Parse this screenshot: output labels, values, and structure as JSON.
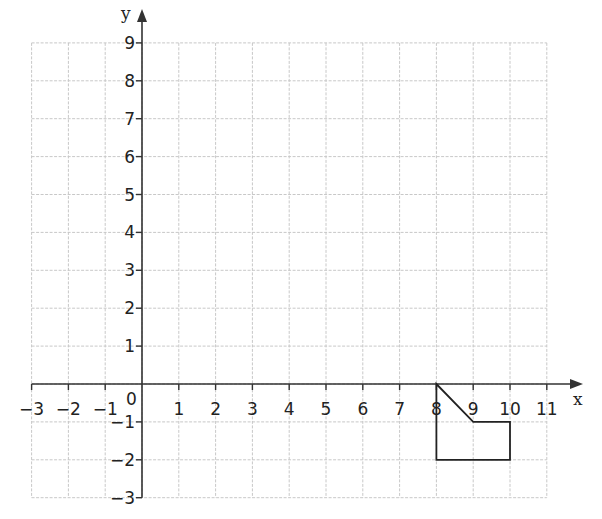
{
  "diagram": {
    "type": "coordinate-grid",
    "x_axis": {
      "label": "x",
      "min": -3,
      "max": 11,
      "ticks": [
        -3,
        -2,
        -1,
        1,
        2,
        3,
        4,
        5,
        6,
        7,
        8,
        9,
        10,
        11
      ],
      "tick_labels": [
        "−3",
        "−2",
        "−1",
        "1",
        "2",
        "3",
        "4",
        "5",
        "6",
        "7",
        "8",
        "9",
        "10",
        "11"
      ]
    },
    "y_axis": {
      "label": "y",
      "min": -3,
      "max": 9,
      "ticks": [
        9,
        8,
        7,
        6,
        5,
        4,
        3,
        2,
        1,
        -1,
        -2,
        -3
      ],
      "tick_labels": [
        "9",
        "8",
        "7",
        "6",
        "5",
        "4",
        "3",
        "2",
        "1",
        "−1",
        "−2",
        "−3"
      ]
    },
    "origin_label": "0",
    "grid": {
      "on": true,
      "style": "dashed",
      "color": "#c8c8c8"
    },
    "axis_color": "#333333",
    "shape": {
      "name": "pentagon",
      "vertices": [
        [
          8,
          0
        ],
        [
          9,
          -1
        ],
        [
          10,
          -1
        ],
        [
          10,
          -2
        ],
        [
          8,
          -2
        ]
      ],
      "stroke": "#222222"
    }
  }
}
